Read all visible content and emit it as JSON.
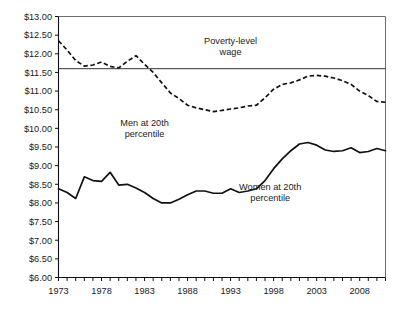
{
  "chart_data": {
    "type": "line",
    "title": "",
    "xlabel": "",
    "ylabel": "",
    "xlim": [
      1973,
      2011
    ],
    "ylim": [
      6.0,
      13.0
    ],
    "grid": false,
    "legend_position": "inline-annotation",
    "y_tick_labels": [
      "$13.00",
      "$12.50",
      "$12.00",
      "$11.50",
      "$11.00",
      "$10.50",
      "$10.00",
      "$9.50",
      "$9.00",
      "$8.50",
      "$8.00",
      "$7.50",
      "$7.00",
      "$6.50",
      "$6.00"
    ],
    "y_tick_values": [
      13.0,
      12.5,
      12.0,
      11.5,
      11.0,
      10.5,
      10.0,
      9.5,
      9.0,
      8.5,
      8.0,
      7.5,
      7.0,
      6.5,
      6.0
    ],
    "x_tick_labels": [
      "1973",
      "1978",
      "1983",
      "1988",
      "1993",
      "1998",
      "2003",
      "2008"
    ],
    "x_tick_values": [
      1973,
      1978,
      1983,
      1988,
      1993,
      1998,
      2003,
      2008
    ],
    "x_minor_step": 1,
    "annotations": [
      {
        "name": "poverty-level-wage",
        "text_line1": "Poverty-level",
        "text_line2": "wage",
        "x": 1993.0,
        "y": 12.25
      },
      {
        "name": "men-20th-percentile",
        "text_line1": "Men at 20th",
        "text_line2": "percentile",
        "x": 1983.0,
        "y": 10.05
      },
      {
        "name": "women-20th-percentile",
        "text_line1": "Women at 20th",
        "text_line2": "percentile",
        "x": 1997.6,
        "y": 8.35
      }
    ],
    "reference_lines": [
      {
        "name": "poverty-level-wage-line",
        "value": 11.6,
        "label": "Poverty-level wage",
        "style": "solid"
      }
    ],
    "series": [
      {
        "name": "Men at 20th percentile",
        "style": "dashed",
        "color": "#111111",
        "x": [
          1973,
          1974,
          1975,
          1976,
          1977,
          1978,
          1979,
          1980,
          1981,
          1982,
          1983,
          1984,
          1985,
          1986,
          1987,
          1988,
          1989,
          1990,
          1991,
          1992,
          1993,
          1994,
          1995,
          1996,
          1997,
          1998,
          1999,
          2000,
          2001,
          2002,
          2003,
          2004,
          2005,
          2006,
          2007,
          2008,
          2009,
          2010,
          2011
        ],
        "values": [
          12.35,
          12.1,
          11.82,
          11.67,
          11.7,
          11.78,
          11.66,
          11.62,
          11.8,
          11.95,
          11.72,
          11.5,
          11.22,
          10.95,
          10.8,
          10.62,
          10.55,
          10.5,
          10.45,
          10.48,
          10.52,
          10.55,
          10.6,
          10.62,
          10.82,
          11.05,
          11.18,
          11.22,
          11.3,
          11.4,
          11.42,
          11.4,
          11.35,
          11.28,
          11.18,
          11.0,
          10.88,
          10.72,
          10.7
        ],
        "label_last": 10.7
      },
      {
        "name": "Women at 20th percentile",
        "style": "solid",
        "color": "#111111",
        "x": [
          1973,
          1974,
          1975,
          1976,
          1977,
          1978,
          1979,
          1980,
          1981,
          1982,
          1983,
          1984,
          1985,
          1986,
          1987,
          1988,
          1989,
          1990,
          1991,
          1992,
          1993,
          1994,
          1995,
          1996,
          1997,
          1998,
          1999,
          2000,
          2001,
          2002,
          2003,
          2004,
          2005,
          2006,
          2007,
          2008,
          2009,
          2010,
          2011
        ],
        "values": [
          8.38,
          8.28,
          8.12,
          8.7,
          8.6,
          8.58,
          8.82,
          8.48,
          8.5,
          8.4,
          8.28,
          8.12,
          8.0,
          8.0,
          8.1,
          8.22,
          8.32,
          8.32,
          8.26,
          8.26,
          8.38,
          8.28,
          8.32,
          8.38,
          8.6,
          8.92,
          9.18,
          9.4,
          9.58,
          9.62,
          9.55,
          9.42,
          9.38,
          9.4,
          9.48,
          9.35,
          9.38,
          9.46,
          9.4
        ],
        "label_last": 9.4
      }
    ]
  },
  "figure": {
    "background_color": "#ffffff",
    "axis_color": "#111111",
    "frame_color": "#6e6e6e",
    "series_color": "#111111"
  }
}
